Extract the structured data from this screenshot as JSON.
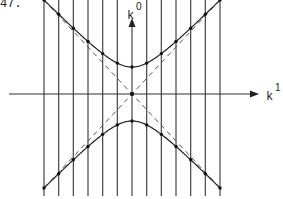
{
  "figure": {
    "number_label": "47.",
    "axes": {
      "vertical": {
        "label": "k",
        "superscript": "0"
      },
      "horizontal": {
        "label": "k",
        "superscript": "1"
      }
    },
    "grid": {
      "vertical_line_count": 13,
      "spacing_px": 14.7
    },
    "colors": {
      "ink": "#222222",
      "background": "#ffffff"
    }
  }
}
